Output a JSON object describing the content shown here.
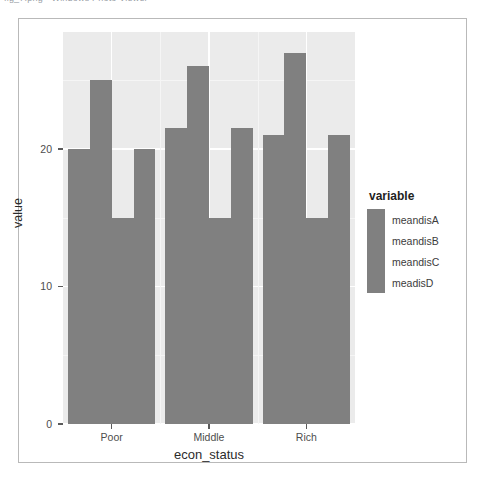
{
  "top_strip": {
    "clipped_text": "fig_7.png - Windows Photo Viewer"
  },
  "chart_data": {
    "type": "bar",
    "title": "",
    "subtitle": "",
    "xlabel": "econ_status",
    "ylabel": "value",
    "categories": [
      "Poor",
      "Middle",
      "Rich"
    ],
    "series": [
      {
        "name": "meandisA",
        "values": [
          20.0,
          21.5,
          21.0
        ]
      },
      {
        "name": "meandisB",
        "values": [
          25.0,
          26.0,
          27.0
        ]
      },
      {
        "name": "meandisC",
        "values": [
          15.0,
          15.0,
          15.0
        ]
      },
      {
        "name": "meadisD",
        "values": [
          20.0,
          21.5,
          21.0
        ]
      }
    ],
    "ylim": [
      0,
      28.5
    ],
    "yticks": [
      0,
      10,
      20
    ],
    "ytick_labels": [
      "0",
      "10",
      "20"
    ],
    "grid": true,
    "legend_position": "right",
    "legend_title": "variable",
    "bar_color": "#808080",
    "panel_background": "#ebebeb",
    "gridline_color": "#ffffff",
    "axis_text_color": "#4d4d4d",
    "axis_title_color": "#2b2b2b"
  }
}
